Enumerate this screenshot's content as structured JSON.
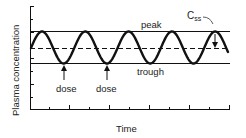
{
  "figure": {
    "ylabel": "Plasma concentration",
    "xlabel": "Time",
    "annotations": {
      "peak": "peak",
      "trough": "trough",
      "css_main": "C",
      "css_sub": "ss",
      "dose_1": "dose",
      "dose_2": "dose"
    },
    "colors": {
      "line": "#111111",
      "text": "#222222",
      "background": "#ffffff"
    }
  },
  "chart_data": {
    "type": "line",
    "title": "",
    "xlabel": "Time",
    "ylabel": "Plasma concentration",
    "grid": false,
    "legend": null,
    "series": [
      {
        "name": "plasma concentration (oscillating, steady state)",
        "style": "solid-thick",
        "description": "sinusoid oscillating between trough and peak",
        "peaks_x_relative": [
          0.06,
          0.28,
          0.49,
          0.71,
          0.93
        ],
        "troughs_x_relative": [
          0.17,
          0.39,
          0.6,
          0.82
        ]
      },
      {
        "name": "peak",
        "style": "solid-thin",
        "level": "peak"
      },
      {
        "name": "Css",
        "style": "dashed",
        "level": "average steady-state concentration"
      },
      {
        "name": "trough",
        "style": "solid-thin",
        "level": "trough"
      }
    ],
    "annotations": [
      {
        "text": "peak",
        "target": "upper horizontal line"
      },
      {
        "text": "trough",
        "target": "lower horizontal line"
      },
      {
        "text": "Css",
        "target": "dashed line (arrow from peak to mean)"
      },
      {
        "text": "dose",
        "target": "first trough (arrow up)"
      },
      {
        "text": "dose",
        "target": "second trough (arrow up)"
      }
    ],
    "x_ticks": 10,
    "y_ticks": 8,
    "tick_labels": false
  }
}
